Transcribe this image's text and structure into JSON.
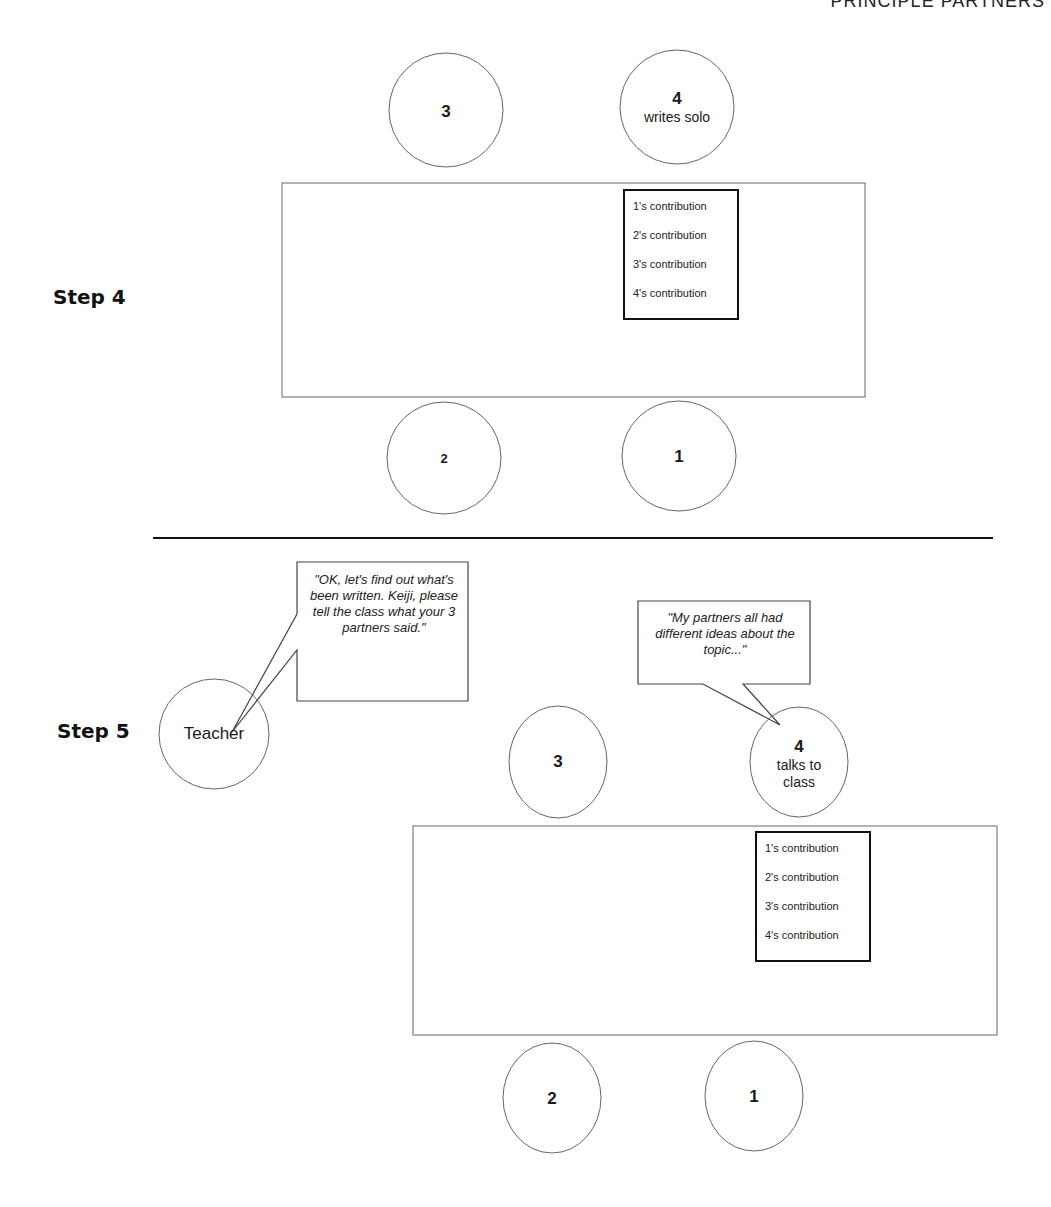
{
  "header": {
    "running_title": "PRINCIPLE PARTNERS"
  },
  "step4": {
    "label": "Step 4",
    "seats": {
      "seat3": {
        "number": "3",
        "role": ""
      },
      "seat4": {
        "number": "4",
        "role": "writes solo"
      },
      "seat2": {
        "number": "2",
        "role": ""
      },
      "seat1": {
        "number": "1",
        "role": ""
      }
    },
    "contributions": [
      "1's contribution",
      "2's contribution",
      "3's contribution",
      "4's contribution"
    ]
  },
  "step5": {
    "label": "Step 5",
    "teacher": {
      "label": "Teacher",
      "speech": "\"OK, let's find out what's been written. Keiji, please tell the class what your 3 partners said.\""
    },
    "student_speech": "\"My partners all had different ideas about the topic...\"",
    "seats": {
      "seat3": {
        "number": "3",
        "role": ""
      },
      "seat4": {
        "number": "4",
        "role": "talks to class"
      },
      "seat2": {
        "number": "2",
        "role": ""
      },
      "seat1": {
        "number": "1",
        "role": ""
      }
    },
    "contributions": [
      "1's contribution",
      "2's contribution",
      "3's contribution",
      "4's contribution"
    ]
  },
  "colors": {
    "stroke": "#555555",
    "bold_stroke": "#111111",
    "background": "#ffffff"
  }
}
